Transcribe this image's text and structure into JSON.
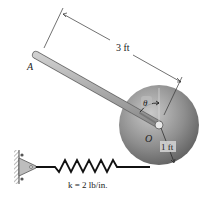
{
  "figure": {
    "point_A_label": "A",
    "pivot_label": "O",
    "angle_label": "θ",
    "rod_length_label": "3 ft",
    "disk_radius_label": "1 ft",
    "spring_label": "k = 2 lb/in."
  },
  "colors": {
    "disk_light": "#c8c8c8",
    "disk_dark": "#6e6e6e",
    "rod": "#a9a9a9",
    "rod_edge": "#6a6a6a",
    "spring": "#111111",
    "dimension_line": "#333333"
  }
}
